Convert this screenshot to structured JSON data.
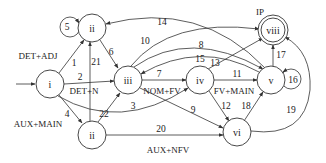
{
  "diagram": {
    "nodes": [
      {
        "id": "i",
        "label": "i"
      },
      {
        "id": "ii_top",
        "label": "ii"
      },
      {
        "id": "iii",
        "label": "iii"
      },
      {
        "id": "iv",
        "label": "iv"
      },
      {
        "id": "v",
        "label": "v"
      },
      {
        "id": "viii",
        "label": "viii",
        "annotation": "IP",
        "final": true
      },
      {
        "id": "ii_bottom",
        "label": "ii"
      },
      {
        "id": "vi",
        "label": "vi"
      }
    ],
    "edges": [
      {
        "id": "1",
        "label": "1",
        "from": "i",
        "to": "ii_top"
      },
      {
        "id": "2",
        "label": "2",
        "from": "i",
        "to": "iii"
      },
      {
        "id": "3",
        "label": "3",
        "from": "i",
        "to": "iv"
      },
      {
        "id": "4",
        "label": "4",
        "from": "i",
        "to": "ii_bottom"
      },
      {
        "id": "5",
        "label": "5",
        "from": "ii_top",
        "to": "ii_top"
      },
      {
        "id": "6",
        "label": "6",
        "from": "ii_top",
        "to": "iii"
      },
      {
        "id": "7",
        "label": "7",
        "from": "iii",
        "to": "iv"
      },
      {
        "id": "8",
        "label": "8",
        "from": "iii",
        "to": "v"
      },
      {
        "id": "9",
        "label": "9",
        "from": "iii",
        "to": "vi"
      },
      {
        "id": "10",
        "label": "10",
        "from": "iii",
        "to": "viii"
      },
      {
        "id": "11",
        "label": "11",
        "from": "iv",
        "to": "v"
      },
      {
        "id": "12",
        "label": "12",
        "from": "iv",
        "to": "vi"
      },
      {
        "id": "13",
        "label": "13",
        "from": "iv",
        "to": "viii"
      },
      {
        "id": "14",
        "label": "14",
        "from": "v",
        "to": "ii_top"
      },
      {
        "id": "15",
        "label": "15",
        "from": "v",
        "to": "iii"
      },
      {
        "id": "16",
        "label": "16",
        "from": "v",
        "to": "v"
      },
      {
        "id": "17",
        "label": "17",
        "from": "v",
        "to": "viii"
      },
      {
        "id": "18",
        "label": "18",
        "from": "vi",
        "to": "v"
      },
      {
        "id": "19",
        "label": "19",
        "from": "vi",
        "to": "viii"
      },
      {
        "id": "20",
        "label": "20",
        "from": "ii_bottom",
        "to": "vi"
      },
      {
        "id": "21",
        "label": "21",
        "from": "ii_bottom",
        "to": "ii_top"
      },
      {
        "id": "22",
        "label": "22",
        "from": "ii_bottom",
        "to": "iii"
      }
    ],
    "annotations": {
      "det_adj": "DET+ADJ",
      "det_n": "DET+N",
      "aux_main": "AUX+MAIN",
      "nom_fv": "NOM+FV",
      "fv_main": "FV+MAIN",
      "aux_nfv": "AUX+NFV",
      "ip": "IP"
    }
  }
}
